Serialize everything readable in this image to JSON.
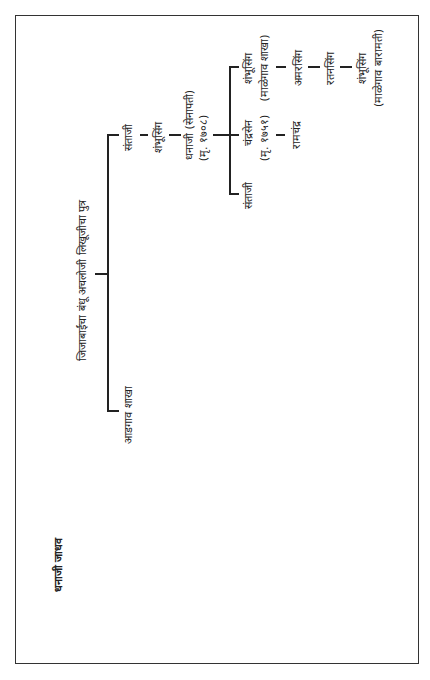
{
  "title": "धनाजी जाधव",
  "root": "जिजाबाईंचा बंधू अचलोजी लिखूजीचा पुत्र",
  "branches": {
    "adgaon": "आडगाव शाखा",
    "santaji_1": "संताजी",
    "shambhusing_1": "शंभूसिंग",
    "dhanaji": {
      "line1": "धनाजी (सेनापती)",
      "line2": "(मृ. १७०८)"
    }
  },
  "children": {
    "santaji_2": "संताजी",
    "chandrasen": {
      "line1": "चंद्रसेन",
      "line2": "(मृ. १७५१)"
    },
    "ramchandra": "रामचंद्र",
    "shambhusing_2": {
      "line1": "शंभूसिंग",
      "line2": "(माळेगाव शाखा)"
    },
    "amarsing": "अमरसिंग",
    "ratansing": "रतनसिंग",
    "shambhusing_3": {
      "line1": "शंभूसिंग",
      "line2": "(माळेगाव बारामती)"
    }
  }
}
